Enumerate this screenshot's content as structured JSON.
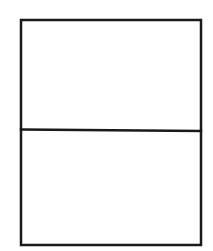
{
  "canvas": {
    "width": 213,
    "height": 251,
    "background": "#ffffff"
  },
  "diagram": {
    "type": "divided-rectangle",
    "stroke_color": "#1a1a1a",
    "stroke_width": 2.5,
    "outer_box": {
      "x": 21,
      "y": 20,
      "width": 180,
      "height": 225
    },
    "divider": {
      "x1": 21,
      "y1": 129.5,
      "x2": 201,
      "y2": 131
    },
    "panels": [
      {
        "name": "top-panel",
        "label": ""
      },
      {
        "name": "bottom-panel",
        "label": ""
      }
    ]
  }
}
